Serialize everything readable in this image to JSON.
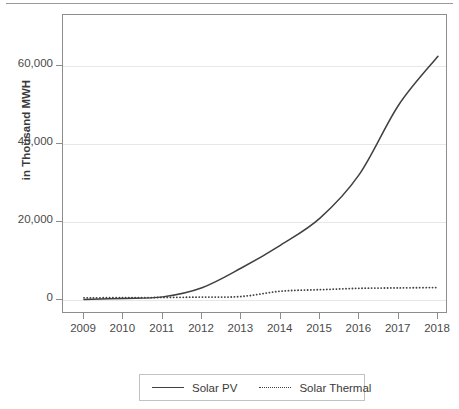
{
  "figure": {
    "has_top_rule": true,
    "background": "#ffffff",
    "line_color": "#404040",
    "grid_color": "#e7e7e7",
    "axis_color": "#8d8d8d"
  },
  "axes": {
    "ylabel": "in Thousand MWH",
    "yticks": [
      "0",
      "20,000",
      "40,000",
      "60,000"
    ],
    "ytick_values": [
      0,
      20000,
      40000,
      60000
    ],
    "xticks": [
      "2009",
      "2010",
      "2011",
      "2012",
      "2013",
      "2014",
      "2015",
      "2016",
      "2017",
      "2018"
    ]
  },
  "legend": {
    "entries": [
      {
        "label": "Solar PV",
        "style": "solid"
      },
      {
        "label": "Solar Thermal",
        "style": "dotted"
      }
    ]
  },
  "chart_data": {
    "type": "line",
    "title": "",
    "subtitle": "",
    "xlabel": "",
    "ylabel": "in Thousand MWH",
    "x": [
      2009,
      2010,
      2011,
      2012,
      2013,
      2014,
      2015,
      2016,
      2017,
      2018
    ],
    "categories": [
      "2009",
      "2010",
      "2011",
      "2012",
      "2013",
      "2014",
      "2015",
      "2016",
      "2017",
      "2018"
    ],
    "series": [
      {
        "name": "Solar PV",
        "style": "solid",
        "values": [
          160,
          400,
          800,
          3150,
          8200,
          14100,
          21000,
          32200,
          50000,
          62500
        ]
      },
      {
        "name": "Solar Thermal",
        "style": "dotted",
        "values": [
          550,
          600,
          650,
          750,
          900,
          2250,
          2650,
          3000,
          3100,
          3200
        ]
      }
    ],
    "xlim": [
      2009,
      2018
    ],
    "ylim": [
      -4000,
      74000
    ],
    "ytick_values": [
      0,
      20000,
      40000,
      60000
    ],
    "grid": "horizontal",
    "legend_position": "bottom-center"
  }
}
